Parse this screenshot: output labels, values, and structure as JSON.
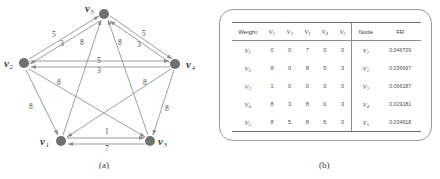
{
  "figure": {
    "panel_a": {
      "caption": "(a)",
      "graph": {
        "type": "directed-weighted-graph",
        "nodes": [
          {
            "id": "v1",
            "label": "v",
            "sub": "1",
            "x": 61,
            "y": 141,
            "label_x": 40,
            "label_y": 136
          },
          {
            "id": "v2",
            "label": "v",
            "sub": "2",
            "x": 24,
            "y": 63,
            "label_x": 4,
            "label_y": 58
          },
          {
            "id": "v3",
            "label": "v",
            "sub": "3",
            "x": 150,
            "y": 141,
            "label_x": 158,
            "label_y": 136
          },
          {
            "id": "v4",
            "label": "v",
            "sub": "4",
            "x": 175,
            "y": 64,
            "label_x": 186,
            "label_y": 59
          },
          {
            "id": "v5",
            "label": "v",
            "sub": "5",
            "x": 104,
            "y": 14,
            "label_x": 85,
            "label_y": 3
          }
        ],
        "edges": [
          {
            "from": "v2",
            "to": "v5",
            "weight": 5,
            "label_x": 52,
            "label_y": 31
          },
          {
            "from": "v5",
            "to": "v2",
            "weight": 3,
            "label_x": 60,
            "label_y": 40
          },
          {
            "from": "v5",
            "to": "v4",
            "weight": 5,
            "label_x": 142,
            "label_y": 30
          },
          {
            "from": "v4",
            "to": "v5",
            "weight": 3,
            "label_x": 137,
            "label_y": 41
          },
          {
            "from": "v2",
            "to": "v4",
            "weight": 5,
            "label_x": 97,
            "label_y": 57
          },
          {
            "from": "v4",
            "to": "v2",
            "weight": 3,
            "label_x": 97,
            "label_y": 67
          },
          {
            "from": "v1",
            "to": "v3",
            "weight": 1,
            "label_x": 105,
            "label_y": 131
          },
          {
            "from": "v3",
            "to": "v1",
            "weight": 7,
            "label_x": 105,
            "label_y": 144
          },
          {
            "from": "v1",
            "to": "v5",
            "weight": 8,
            "label_x": 80,
            "label_y": 39
          },
          {
            "from": "v3",
            "to": "v5",
            "weight": 8,
            "label_x": 118,
            "label_y": 39
          },
          {
            "from": "v2",
            "to": "v3",
            "weight": 8,
            "label_x": 57,
            "label_y": 79
          },
          {
            "from": "v4",
            "to": "v1",
            "weight": 8,
            "label_x": 143,
            "label_y": 79
          },
          {
            "from": "v2",
            "to": "v1",
            "weight": 8,
            "label_x": 29,
            "label_y": 103
          },
          {
            "from": "v4",
            "to": "v3",
            "weight": 8,
            "label_x": 165,
            "label_y": 105
          }
        ]
      }
    },
    "panel_b": {
      "caption": "(b)",
      "table": {
        "weight_header": "Weight",
        "column_headers": [
          {
            "label": "V",
            "sub": "1"
          },
          {
            "label": "V",
            "sub": "2"
          },
          {
            "label": "V",
            "sub": "3"
          },
          {
            "label": "V",
            "sub": "4"
          },
          {
            "label": "V",
            "sub": "5"
          }
        ],
        "node_header": "Node",
        "fr_header": "FR",
        "rows": [
          {
            "row_label": "V",
            "row_sub": "1",
            "weights": [
              0,
              0,
              7,
              0,
              0
            ],
            "node_label": "V",
            "node_sub": "1",
            "fr": "0.046709"
          },
          {
            "row_label": "V",
            "row_sub": "2",
            "weights": [
              8,
              0,
              8,
              5,
              3
            ],
            "node_label": "V",
            "node_sub": "2",
            "fr": "0.036697"
          },
          {
            "row_label": "V",
            "row_sub": "3",
            "weights": [
              1,
              0,
              0,
              0,
              0
            ],
            "node_label": "V",
            "node_sub": "3",
            "fr": "0.066187"
          },
          {
            "row_label": "V",
            "row_sub": "4",
            "weights": [
              8,
              3,
              8,
              0,
              3
            ],
            "node_label": "V",
            "node_sub": "4",
            "fr": "0.029181"
          },
          {
            "row_label": "V",
            "row_sub": "5",
            "weights": [
              8,
              5,
              8,
              5,
              0
            ],
            "node_label": "V",
            "node_sub": "5",
            "fr": "0.034618"
          }
        ]
      }
    }
  },
  "colors": {
    "node_fill": "#707070",
    "edge_stroke": "#8d8d8d",
    "text": "#3a3a3a",
    "rule": "#6f6f6f"
  }
}
